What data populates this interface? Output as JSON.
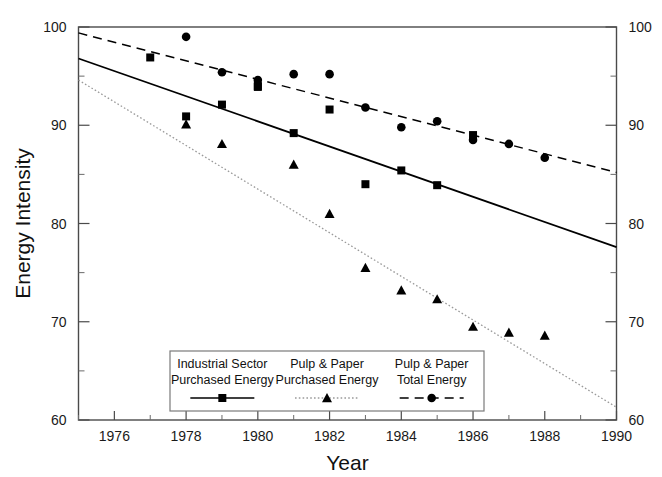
{
  "chart_data": {
    "type": "scatter",
    "title": "",
    "xlabel": "Year",
    "ylabel": "Energy Intensity",
    "xlim": [
      1975,
      1990
    ],
    "ylim": [
      60,
      100
    ],
    "xticks": [
      1976,
      1978,
      1980,
      1982,
      1984,
      1986,
      1988,
      1990
    ],
    "xtick_labels": [
      "1976",
      "1978",
      "1980",
      "1982",
      "1984",
      "1986",
      "1988",
      "1990"
    ],
    "xminor_step": 1,
    "yticks": [
      60,
      70,
      80,
      90,
      100
    ],
    "ytick_labels": [
      "60",
      "70",
      "80",
      "90",
      "100"
    ],
    "yminor_step": 5,
    "grid": false,
    "y_axis_duplicated_right": true,
    "legend_position": "inside-bottom-center",
    "series": [
      {
        "name": "Industrial Sector Purchased Energy",
        "label_line1": "Industrial Sector",
        "label_line2": "Purchased Energy",
        "marker": "square",
        "line_style": "solid",
        "color": "#000000",
        "x": [
          1977,
          1979,
          1980,
          1981,
          1982,
          1983,
          1984,
          1985,
          1986
        ],
        "y": [
          96.9,
          92.1,
          94.0,
          89.2,
          91.6,
          84.0,
          85.4,
          83.9,
          89.0
        ],
        "points": [
          {
            "x": 1977,
            "y": 96.9
          },
          {
            "x": 1979,
            "y": 92.1
          },
          {
            "x": 1980,
            "y": 94.0
          },
          {
            "x": 1981,
            "y": 89.2
          },
          {
            "x": 1982,
            "y": 91.6
          },
          {
            "x": 1983,
            "y": 84.0
          },
          {
            "x": 1984,
            "y": 85.4
          },
          {
            "x": 1985,
            "y": 83.9
          },
          {
            "x": 1986,
            "y": 89.0
          }
        ],
        "trend_line": {
          "x0": 1975,
          "y0": 96.8,
          "x1": 1990,
          "y1": 77.6
        }
      },
      {
        "name": "Pulp & Paper Purchased Energy",
        "label_line1": "Pulp & Paper",
        "label_line2": "Purchased Energy",
        "marker": "triangle",
        "line_style": "dotted",
        "color": "#000000",
        "x": [
          1978,
          1979,
          1981,
          1982,
          1983,
          1984,
          1985,
          1986,
          1987,
          1988
        ],
        "y": [
          90.1,
          88.1,
          86.0,
          81.0,
          75.5,
          73.2,
          72.3,
          69.5,
          68.9,
          68.6
        ],
        "points": [
          {
            "x": 1978,
            "y": 90.1
          },
          {
            "x": 1979,
            "y": 88.1
          },
          {
            "x": 1981,
            "y": 86.0
          },
          {
            "x": 1982,
            "y": 81.0
          },
          {
            "x": 1983,
            "y": 75.5
          },
          {
            "x": 1984,
            "y": 73.2
          },
          {
            "x": 1985,
            "y": 72.3
          },
          {
            "x": 1986,
            "y": 69.5
          },
          {
            "x": 1987,
            "y": 68.9
          },
          {
            "x": 1988,
            "y": 68.6
          }
        ],
        "trend_line": {
          "x0": 1975,
          "y0": 94.6,
          "x1": 1990,
          "y1": 61.3
        }
      },
      {
        "name": "Pulp & Paper Total Energy",
        "label_line1": "Pulp & Paper",
        "label_line2": "Total Energy",
        "marker": "circle",
        "line_style": "dashed",
        "color": "#000000",
        "x": [
          1978,
          1979,
          1980,
          1981,
          1982,
          1983,
          1984,
          1985,
          1986,
          1987,
          1988
        ],
        "y": [
          99.0,
          95.4,
          94.6,
          95.2,
          95.2,
          91.8,
          89.8,
          90.4,
          88.5,
          88.1,
          86.7
        ],
        "points": [
          {
            "x": 1978,
            "y": 99.0
          },
          {
            "x": 1979,
            "y": 95.4
          },
          {
            "x": 1980,
            "y": 94.6
          },
          {
            "x": 1981,
            "y": 95.2
          },
          {
            "x": 1982,
            "y": 95.2
          },
          {
            "x": 1983,
            "y": 91.8
          },
          {
            "x": 1984,
            "y": 89.8
          },
          {
            "x": 1985,
            "y": 90.4
          },
          {
            "x": 1986,
            "y": 88.5
          },
          {
            "x": 1987,
            "y": 88.1
          },
          {
            "x": 1988,
            "y": 86.7
          }
        ],
        "trend_line": {
          "x0": 1975,
          "y0": 99.4,
          "x1": 1990,
          "y1": 85.2
        }
      },
      {
        "name": "Industrial Sector extra point 1978",
        "label_line1": "",
        "label_line2": "",
        "marker": "square",
        "line_style": "none",
        "color": "#000000",
        "x": [
          1978
        ],
        "y": [
          90.9
        ],
        "points": [
          {
            "x": 1978,
            "y": 90.9
          }
        ],
        "trend_line": null
      },
      {
        "name": "Pulp & Paper Total Energy extra point 1980",
        "label_line1": "",
        "label_line2": "",
        "marker": "square",
        "line_style": "none",
        "color": "#000000",
        "x": [
          1980
        ],
        "y": [
          93.9
        ],
        "points": [
          {
            "x": 1980,
            "y": 93.9
          }
        ],
        "trend_line": null
      }
    ]
  },
  "axes": {
    "x_title": "Year",
    "y_title": "Energy Intensity",
    "x_tick_labels": [
      "1976",
      "1978",
      "1980",
      "1982",
      "1984",
      "1986",
      "1988",
      "1990"
    ],
    "y_tick_labels_left": [
      "100",
      "90",
      "80",
      "70",
      "60"
    ],
    "y_tick_labels_right": [
      "100",
      "90",
      "80",
      "70",
      "60"
    ]
  },
  "legend": {
    "entries": [
      {
        "line1": "Industrial Sector",
        "line2": "Purchased Energy",
        "marker": "square-icon",
        "style": "solid"
      },
      {
        "line1": "Pulp & Paper",
        "line2": "Purchased Energy",
        "marker": "triangle-icon",
        "style": "dotted"
      },
      {
        "line1": "Pulp & Paper",
        "line2": "Total Energy",
        "marker": "circle-icon",
        "style": "dashed"
      }
    ]
  }
}
